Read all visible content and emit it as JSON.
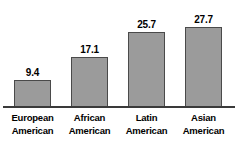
{
  "chart_data": {
    "type": "bar",
    "title": "",
    "xlabel": "",
    "ylabel": "",
    "categories": [
      "European American",
      "African American",
      "Latin American",
      "Asian American"
    ],
    "category_lines": [
      [
        "European",
        "American"
      ],
      [
        "African",
        "American"
      ],
      [
        "Latin",
        "American"
      ],
      [
        "Asian",
        "American"
      ]
    ],
    "values": [
      9.4,
      17.1,
      25.7,
      27.7
    ],
    "value_labels": [
      "9.4",
      "17.1",
      "25.7",
      "27.7"
    ],
    "ylim": [
      0,
      30
    ],
    "grid": false,
    "legend": false,
    "axis_visible": {
      "x": true,
      "y": false
    },
    "colors": {
      "bar_fill": "#9b9b9b",
      "bar_border": "#4a4a4a",
      "axis": "#3a3a3a",
      "text": "#000000",
      "background": "#ffffff"
    }
  }
}
